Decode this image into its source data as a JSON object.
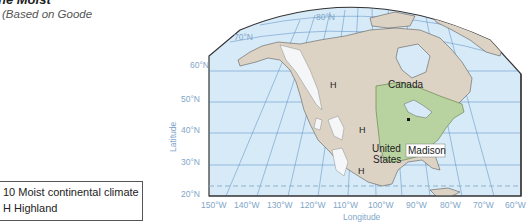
{
  "header": {
    "title": "he Moist",
    "subtitle": "(Based on Goode"
  },
  "legend": {
    "items": [
      {
        "label": "10 Moist continental climate"
      },
      {
        "label": "H Highland"
      }
    ]
  },
  "map": {
    "latitude_ticks": [
      "80°N",
      "70°N",
      "60°N",
      "50°N",
      "40°N",
      "30°N",
      "20°N"
    ],
    "longitude_ticks": [
      "150°W",
      "140°W",
      "130°W",
      "120°W",
      "110°W",
      "100°W",
      "90°W",
      "80°W",
      "70°W",
      "60°W"
    ],
    "x_axis_label": "Longitude",
    "y_axis_label": "Latitude",
    "place_labels": {
      "canada": "Canada",
      "united": "United",
      "states": "States",
      "madison": "Madison",
      "highland": "H"
    },
    "colors": {
      "ocean": "#d8eaf7",
      "land": "#ddd3c5",
      "moist_continental": "#b9d3a0",
      "highland": "#f4f6f8",
      "grid": "#4f87bf"
    }
  }
}
